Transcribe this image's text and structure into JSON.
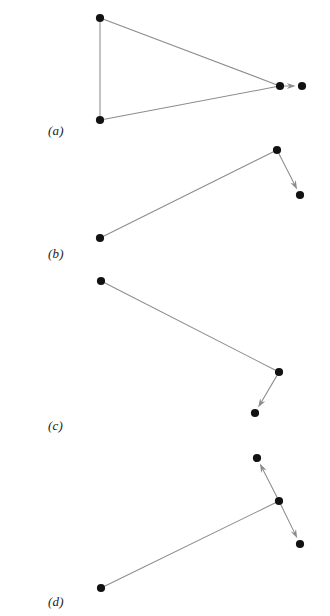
{
  "figure": {
    "background_color": "#ffffff",
    "node_color": "#121212",
    "edge_color": "#8c8c8c",
    "label_color": "#1a1a1a",
    "node_radius": 4.1,
    "width": 330,
    "height": 616
  },
  "panels": [
    {
      "id": "panel-a",
      "label": "(a)",
      "label_x": 48,
      "label_y": 123,
      "nodes": [
        {
          "name": "node-a-top-left",
          "x": 100,
          "y": 18
        },
        {
          "name": "node-a-bottom-left",
          "x": 100,
          "y": 120
        },
        {
          "name": "node-a-apex",
          "x": 280,
          "y": 86
        },
        {
          "name": "node-a-target",
          "x": 302,
          "y": 86
        }
      ],
      "edges": [
        {
          "name": "edge-a-left-vertical",
          "x1": 100,
          "y1": 18,
          "x2": 100,
          "y2": 120,
          "arrow": false
        },
        {
          "name": "edge-a-top-to-apex",
          "x1": 100,
          "y1": 18,
          "x2": 280,
          "y2": 86,
          "arrow": false
        },
        {
          "name": "edge-a-bottom-to-apex",
          "x1": 100,
          "y1": 120,
          "x2": 280,
          "y2": 86,
          "arrow": false
        },
        {
          "name": "edge-a-apex-to-target",
          "x1": 280,
          "y1": 86,
          "x2": 302,
          "y2": 86,
          "arrow": true
        }
      ]
    },
    {
      "id": "panel-b",
      "label": "(b)",
      "label_x": 48,
      "label_y": 246,
      "nodes": [
        {
          "name": "node-b-bottom-left",
          "x": 100,
          "y": 238
        },
        {
          "name": "node-b-top-right",
          "x": 277,
          "y": 150
        },
        {
          "name": "node-b-target",
          "x": 300,
          "y": 195
        }
      ],
      "edges": [
        {
          "name": "edge-b-left-to-top",
          "x1": 100,
          "y1": 238,
          "x2": 277,
          "y2": 150,
          "arrow": false
        },
        {
          "name": "edge-b-top-to-target",
          "x1": 277,
          "y1": 150,
          "x2": 300,
          "y2": 195,
          "arrow": true
        }
      ]
    },
    {
      "id": "panel-c",
      "label": "(c)",
      "label_x": 48,
      "label_y": 418,
      "nodes": [
        {
          "name": "node-c-top-left",
          "x": 101,
          "y": 281
        },
        {
          "name": "node-c-right",
          "x": 279,
          "y": 372
        },
        {
          "name": "node-c-target",
          "x": 255,
          "y": 413
        }
      ],
      "edges": [
        {
          "name": "edge-c-left-to-right",
          "x1": 101,
          "y1": 281,
          "x2": 279,
          "y2": 372,
          "arrow": false
        },
        {
          "name": "edge-c-right-to-target",
          "x1": 279,
          "y1": 372,
          "x2": 255,
          "y2": 413,
          "arrow": true
        }
      ]
    },
    {
      "id": "panel-d",
      "label": "(d)",
      "label_x": 48,
      "label_y": 594,
      "nodes": [
        {
          "name": "node-d-bottom-left",
          "x": 101,
          "y": 588
        },
        {
          "name": "node-d-center",
          "x": 279,
          "y": 501
        },
        {
          "name": "node-d-target-up",
          "x": 257,
          "y": 458
        },
        {
          "name": "node-d-target-down",
          "x": 300,
          "y": 544
        }
      ],
      "edges": [
        {
          "name": "edge-d-left-to-center",
          "x1": 101,
          "y1": 588,
          "x2": 279,
          "y2": 501,
          "arrow": false
        },
        {
          "name": "edge-d-center-to-up",
          "x1": 279,
          "y1": 501,
          "x2": 257,
          "y2": 458,
          "arrow": true
        },
        {
          "name": "edge-d-center-to-down",
          "x1": 279,
          "y1": 501,
          "x2": 300,
          "y2": 544,
          "arrow": true
        }
      ]
    }
  ]
}
